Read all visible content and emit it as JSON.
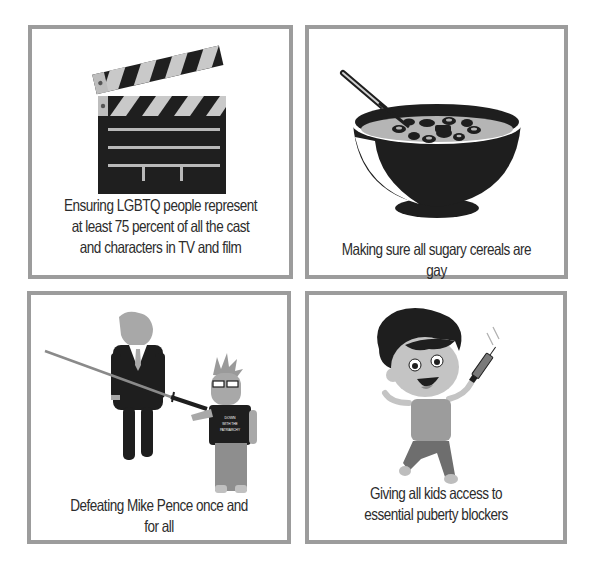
{
  "panels": [
    {
      "id": "film",
      "icon": "clapperboard-icon",
      "caption_lines": [
        "Ensuring LGBTQ people represent",
        "at least 75 percent of all the cast",
        "and characters in TV and film"
      ]
    },
    {
      "id": "cereal",
      "icon": "cereal-bowl-icon",
      "caption_lines": [
        "Making sure all sugary cereals are gay"
      ]
    },
    {
      "id": "pence",
      "icon": "sword-figures-illustration",
      "shirt_text": [
        "DOWN",
        "WITH THE",
        "PATRIARCHY"
      ],
      "caption_lines": [
        "Defeating Mike Pence once and",
        "for all"
      ]
    },
    {
      "id": "blockers",
      "icon": "jumping-kid-syringe-illustration",
      "caption_lines": [
        "Giving all kids access to",
        "essential puberty blockers"
      ]
    }
  ],
  "colors": {
    "border": "#9c9c9c",
    "text": "#2c2c2c",
    "dark": "#1e1e1e",
    "mid_gray": "#a8a8a8",
    "light_gray": "#c8c8c8"
  }
}
